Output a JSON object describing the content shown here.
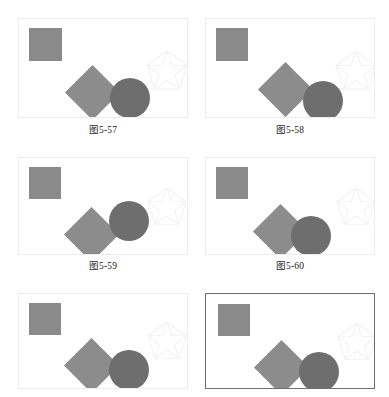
{
  "page": {
    "background_color": "#ffffff",
    "width": 389,
    "height": 397,
    "layout": "2 columns x 3 rows of illustration panels"
  },
  "colors": {
    "square_fill": "#8a8a8a",
    "diamond_fill": "#8c8c8c",
    "circle_fill": "#6e6e6e",
    "star_stroke": "#f2f2f2",
    "panel_border_faint": "#ececec",
    "panel_border_selected": "#6e6e6e",
    "caption_text": "#1a1a1a"
  },
  "panels": [
    {
      "id": "panel-1",
      "caption": "图5-57",
      "has_caption": true,
      "selected": false,
      "shapes": {
        "square": {
          "name": "square",
          "x": 10,
          "y": 9,
          "w": 33,
          "h": 33
        },
        "diamond": {
          "name": "diamond",
          "cx": 73,
          "cy": 73,
          "size": 39
        },
        "circle": {
          "name": "circle",
          "cx": 111,
          "cy": 79,
          "r": 20
        },
        "star": {
          "name": "star",
          "cx": 148,
          "cy": 53,
          "r": 21
        }
      }
    },
    {
      "id": "panel-2",
      "caption": "图5-58",
      "has_caption": true,
      "selected": false,
      "shapes": {
        "square": {
          "name": "square",
          "x": 10,
          "y": 9,
          "w": 32,
          "h": 33
        },
        "diamond": {
          "name": "diamond",
          "cx": 79,
          "cy": 70,
          "size": 39
        },
        "circle": {
          "name": "circle",
          "cx": 117,
          "cy": 82,
          "r": 20
        },
        "star": {
          "name": "star",
          "cx": 150,
          "cy": 53,
          "r": 21
        }
      }
    },
    {
      "id": "panel-3",
      "caption": "图5-59",
      "has_caption": true,
      "selected": false,
      "shapes": {
        "square": {
          "name": "square",
          "x": 10,
          "y": 9,
          "w": 32,
          "h": 32
        },
        "diamond": {
          "name": "diamond",
          "cx": 72,
          "cy": 76,
          "size": 39
        },
        "circle": {
          "name": "circle",
          "cx": 110,
          "cy": 63,
          "r": 20
        },
        "star": {
          "name": "star",
          "cx": 148,
          "cy": 50,
          "r": 20
        }
      }
    },
    {
      "id": "panel-4",
      "caption": "图5-60",
      "has_caption": true,
      "selected": false,
      "shapes": {
        "square": {
          "name": "square",
          "x": 10,
          "y": 9,
          "w": 32,
          "h": 32
        },
        "diamond": {
          "name": "diamond",
          "cx": 74,
          "cy": 73,
          "size": 39
        },
        "circle": {
          "name": "circle",
          "cx": 105,
          "cy": 78,
          "r": 20
        },
        "star": {
          "name": "star",
          "cx": 150,
          "cy": 50,
          "r": 20
        }
      }
    },
    {
      "id": "panel-5",
      "caption": "",
      "has_caption": false,
      "selected": false,
      "shapes": {
        "square": {
          "name": "square",
          "x": 10,
          "y": 9,
          "w": 32,
          "h": 32
        },
        "diamond": {
          "name": "diamond",
          "cx": 72,
          "cy": 71,
          "size": 39
        },
        "circle": {
          "name": "circle",
          "cx": 110,
          "cy": 76,
          "r": 20
        },
        "star": {
          "name": "star",
          "cx": 148,
          "cy": 48,
          "r": 20
        }
      }
    },
    {
      "id": "panel-6",
      "caption": "",
      "has_caption": false,
      "selected": true,
      "shapes": {
        "square": {
          "name": "square",
          "x": 12,
          "y": 10,
          "w": 32,
          "h": 32
        },
        "diamond": {
          "name": "diamond",
          "cx": 75,
          "cy": 73,
          "size": 39
        },
        "circle": {
          "name": "circle",
          "cx": 113,
          "cy": 78,
          "r": 20
        },
        "star": {
          "name": "star",
          "cx": 151,
          "cy": 49,
          "r": 20
        }
      }
    }
  ]
}
